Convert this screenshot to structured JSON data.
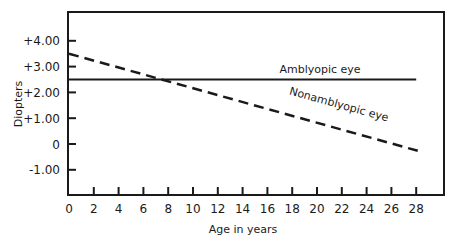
{
  "chart_data": {
    "type": "line",
    "title": "",
    "xlabel": "Age in years",
    "ylabel": "Diopters",
    "xlim": [
      0,
      30
    ],
    "ylim": [
      -2.0,
      5.0
    ],
    "x_ticks": [
      0,
      2,
      4,
      6,
      8,
      10,
      12,
      14,
      16,
      18,
      20,
      22,
      24,
      26,
      28
    ],
    "x_tick_labels": [
      "0",
      "2",
      "4",
      "6",
      "8",
      "10",
      "12",
      "14",
      "16",
      "18",
      "20",
      "22",
      "24",
      "26",
      "28"
    ],
    "y_ticks": [
      4,
      3,
      2,
      1,
      0,
      -1
    ],
    "y_tick_labels": [
      "+4.00",
      "+3.00",
      "+2.00",
      "+1.00",
      "0",
      "-1.00"
    ],
    "grid": false,
    "legend": "inline annotations",
    "series": [
      {
        "name": "Amblyopic eye",
        "style": "solid",
        "x": [
          0,
          28
        ],
        "values": [
          2.5,
          2.5
        ]
      },
      {
        "name": "Nonamblyopic eye",
        "style": "dashed",
        "x": [
          0,
          28.4
        ],
        "values": [
          3.5,
          -0.3
        ]
      }
    ]
  }
}
